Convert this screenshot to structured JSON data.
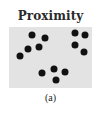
{
  "figure": {
    "title": "Proximity",
    "caption": "(a)",
    "panel_color": "#e3e3e3",
    "dot_color": "#111111",
    "dots": [
      {
        "x": 32,
        "y": 35
      },
      {
        "x": 45,
        "y": 38
      },
      {
        "x": 28,
        "y": 49
      },
      {
        "x": 39,
        "y": 47
      },
      {
        "x": 20,
        "y": 56
      },
      {
        "x": 75,
        "y": 33
      },
      {
        "x": 85,
        "y": 35
      },
      {
        "x": 75,
        "y": 45
      },
      {
        "x": 84,
        "y": 52
      },
      {
        "x": 42,
        "y": 73
      },
      {
        "x": 54,
        "y": 69
      },
      {
        "x": 65,
        "y": 72
      },
      {
        "x": 56,
        "y": 80
      }
    ]
  }
}
